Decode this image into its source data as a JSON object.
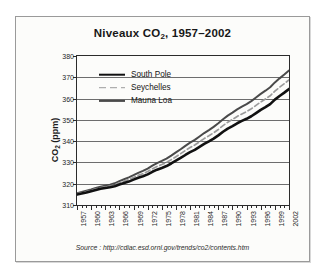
{
  "figure": {
    "source_note": "Source : http://cdiac.esd.ornl.gov/trends/co2/contents.htm"
  },
  "chart_data": {
    "type": "line",
    "title": "Niveaux CO",
    "title_sub": "2",
    "title_tail": ", 1957–2002",
    "title_full": "Niveaux CO2, 1957–2002",
    "xlabel": "",
    "ylabel": "CO",
    "ylabel_sub": "2",
    "ylabel_tail": " (ppm)",
    "ylabel_full": "CO2 (ppm)",
    "ylim": [
      310,
      380
    ],
    "yticks": [
      310,
      320,
      330,
      340,
      350,
      360,
      370,
      380
    ],
    "xlim": [
      1957,
      2002
    ],
    "xticks": [
      1957,
      1960,
      1963,
      1966,
      1969,
      1972,
      1975,
      1978,
      1981,
      1984,
      1987,
      1990,
      1993,
      1996,
      1999,
      2002
    ],
    "x": [
      1957,
      1958,
      1959,
      1960,
      1961,
      1962,
      1963,
      1964,
      1965,
      1966,
      1967,
      1968,
      1969,
      1970,
      1971,
      1972,
      1973,
      1974,
      1975,
      1976,
      1977,
      1978,
      1979,
      1980,
      1981,
      1982,
      1983,
      1984,
      1985,
      1986,
      1987,
      1988,
      1989,
      1990,
      1991,
      1992,
      1993,
      1994,
      1995,
      1996,
      1997,
      1998,
      1999,
      2000,
      2001,
      2002
    ],
    "grid": true,
    "legend_position": "upper-left",
    "series": [
      {
        "name": "South Pole",
        "color": "#111111",
        "style": "solid-thick",
        "values": [
          314.9,
          315.4,
          315.9,
          316.5,
          317.0,
          317.6,
          318.0,
          318.3,
          318.8,
          319.6,
          320.3,
          321.0,
          321.9,
          322.8,
          323.5,
          324.4,
          325.6,
          326.6,
          327.4,
          328.3,
          329.5,
          330.8,
          332.1,
          333.5,
          334.8,
          335.9,
          337.3,
          338.7,
          339.9,
          341.2,
          342.7,
          344.4,
          345.9,
          347.1,
          348.4,
          349.5,
          350.5,
          351.7,
          353.2,
          354.7,
          356.0,
          357.4,
          359.5,
          361.2,
          362.8,
          364.5
        ]
      },
      {
        "name": "Seychelles",
        "color": "#9b9b9b",
        "style": "dashed",
        "values": [
          315.2,
          315.8,
          316.3,
          316.9,
          317.5,
          318.1,
          318.5,
          318.9,
          319.5,
          320.4,
          321.2,
          322.0,
          322.9,
          323.9,
          324.7,
          325.7,
          327.0,
          328.1,
          329.0,
          330.0,
          331.3,
          332.7,
          334.1,
          335.6,
          337.0,
          338.2,
          339.7,
          341.2,
          342.5,
          343.9,
          345.5,
          347.3,
          348.9,
          350.2,
          351.6,
          352.8,
          353.9,
          355.2,
          356.8,
          358.4,
          359.8,
          361.3,
          363.5,
          365.3,
          367.0,
          368.8
        ]
      },
      {
        "name": "Mauna Loa",
        "color": "#4a4a4a",
        "style": "solid-mid",
        "values": [
          315.5,
          316.1,
          316.7,
          317.3,
          318.0,
          318.6,
          319.1,
          319.5,
          320.2,
          321.2,
          322.1,
          323.0,
          324.0,
          325.1,
          326.0,
          327.1,
          328.5,
          329.7,
          330.7,
          331.8,
          333.2,
          334.7,
          336.2,
          337.8,
          339.3,
          340.6,
          342.2,
          343.8,
          345.2,
          346.7,
          348.4,
          350.3,
          352.0,
          353.4,
          354.9,
          356.2,
          357.4,
          358.8,
          360.5,
          362.2,
          363.7,
          365.3,
          367.6,
          369.5,
          371.3,
          373.2
        ]
      }
    ]
  }
}
